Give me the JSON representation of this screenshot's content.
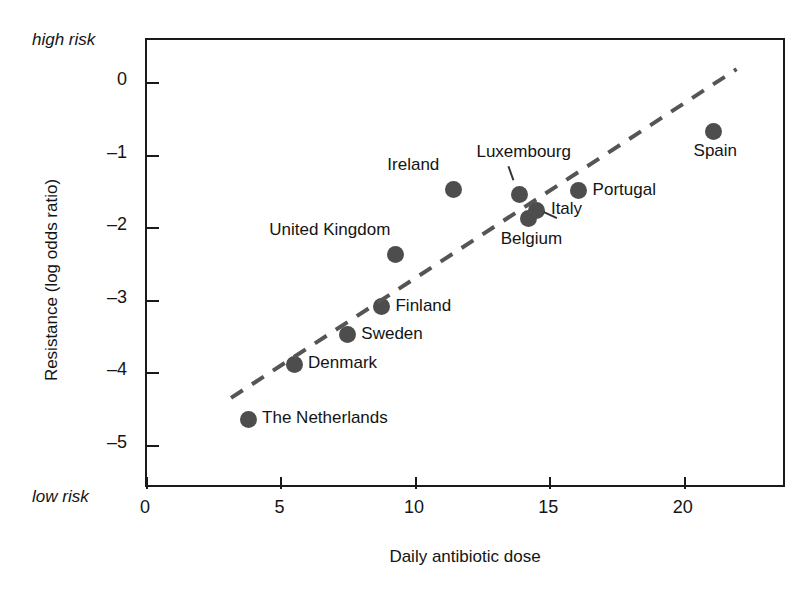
{
  "annotations": {
    "high_risk": "high risk",
    "low_risk": "low risk"
  },
  "chart_data": {
    "type": "scatter",
    "title": "",
    "xlabel": "Daily antibiotic dose",
    "ylabel": "Resistance (log odds ratio)",
    "xlim": [
      0,
      23.8
    ],
    "ylim": [
      -5.6,
      0.6
    ],
    "xticks": [
      "0",
      "5",
      "10",
      "15",
      "20"
    ],
    "xtick_values": [
      0,
      5,
      10,
      15,
      20
    ],
    "yticks": [
      "0",
      "–1",
      "–2",
      "–3",
      "–4",
      "–5"
    ],
    "ytick_values": [
      0,
      -1,
      -2,
      -3,
      -4,
      -5
    ],
    "grid": false,
    "legend": "none",
    "point_color": "#4d4d4d",
    "trendline": {
      "style": "dashed",
      "color": "#555555",
      "x": [
        3.2,
        22.0
      ],
      "y": [
        -4.37,
        0.17
      ]
    },
    "points": [
      {
        "label": "The Netherlands",
        "x": 3.76,
        "y": -4.64,
        "label_pos": "right"
      },
      {
        "label": "Denmark",
        "x": 5.47,
        "y": -3.88,
        "label_pos": "right"
      },
      {
        "label": "Sweden",
        "x": 7.45,
        "y": -3.47,
        "label_pos": "right"
      },
      {
        "label": "Finland",
        "x": 8.72,
        "y": -3.08,
        "label_pos": "right"
      },
      {
        "label": "United Kingdom",
        "x": 9.25,
        "y": -2.36,
        "label_pos": "upper-left"
      },
      {
        "label": "Ireland",
        "x": 11.4,
        "y": -1.46,
        "label_pos": "upper-left"
      },
      {
        "label": "Luxembourg",
        "x": 13.85,
        "y": -1.53,
        "label_pos": "above"
      },
      {
        "label": "Belgium",
        "x": 14.2,
        "y": -1.87,
        "label_pos": "below"
      },
      {
        "label": "Italy",
        "x": 14.5,
        "y": -1.75,
        "label_pos": "right"
      },
      {
        "label": "Portugal",
        "x": 16.05,
        "y": -1.48,
        "label_pos": "right"
      },
      {
        "label": "Spain",
        "x": 21.05,
        "y": -0.66,
        "label_pos": "below"
      }
    ]
  }
}
